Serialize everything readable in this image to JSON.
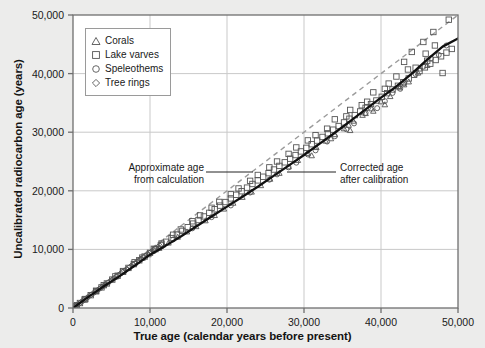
{
  "chart_data": {
    "type": "scatter",
    "title": "",
    "xlabel": "True age (calendar years before present)",
    "ylabel": "Uncalibrated radiocarbon age (years)",
    "xlim": [
      0,
      50000
    ],
    "ylim": [
      0,
      50000
    ],
    "xticks": [
      0,
      10000,
      20000,
      30000,
      40000,
      50000
    ],
    "yticks": [
      0,
      10000,
      20000,
      30000,
      40000,
      50000
    ],
    "xtick_labels": [
      "0",
      "10,000",
      "20,000",
      "30,000",
      "40,000",
      "50,000"
    ],
    "ytick_labels": [
      "0",
      "10,000",
      "20,000",
      "30,000",
      "40,000",
      "50,000"
    ],
    "grid": true,
    "legend_position": "upper-left",
    "legend_entries": [
      {
        "label": "Corals",
        "marker": "triangle"
      },
      {
        "label": "Lake varves",
        "marker": "square"
      },
      {
        "label": "Speleothems",
        "marker": "circle"
      },
      {
        "label": "Tree rings",
        "marker": "diamond"
      }
    ],
    "annotations": [
      {
        "name": "approximate-age",
        "line1": "Approximate age",
        "line2": "from calculation",
        "points_to": "one-to-one-dashed-line"
      },
      {
        "name": "corrected-age",
        "line1": "Corrected age",
        "line2": "after calibration",
        "points_to": "calibration-curve"
      }
    ],
    "reference_line": {
      "name": "one-to-one-line",
      "style": "dashed",
      "color": "#9b9b9b",
      "x": [
        0,
        50000
      ],
      "y": [
        0,
        50000
      ]
    },
    "calibration_curve": {
      "name": "calibration-curve",
      "style": "solid",
      "color": "#111111",
      "x": [
        0,
        2000,
        4000,
        6000,
        8000,
        10000,
        12000,
        14000,
        16000,
        18000,
        20000,
        22000,
        24000,
        26000,
        28000,
        30000,
        32000,
        34000,
        36000,
        38000,
        40000,
        42000,
        44000,
        46000,
        48000,
        50000
      ],
      "y": [
        0,
        1900,
        3700,
        5400,
        7200,
        9100,
        10600,
        12200,
        13900,
        15600,
        17300,
        19000,
        20700,
        22500,
        24300,
        26100,
        28000,
        29900,
        31900,
        33900,
        35900,
        37800,
        40000,
        42400,
        44600,
        46000
      ]
    },
    "series": [
      {
        "name": "Tree rings",
        "marker": "diamond",
        "points": [
          [
            180,
            170
          ],
          [
            420,
            400
          ],
          [
            700,
            660
          ],
          [
            980,
            930
          ],
          [
            1250,
            1190
          ],
          [
            1520,
            1450
          ],
          [
            1800,
            1720
          ],
          [
            2060,
            1970
          ],
          [
            2340,
            2230
          ],
          [
            2600,
            2480
          ],
          [
            2880,
            2740
          ],
          [
            3150,
            3000
          ],
          [
            3420,
            3260
          ],
          [
            3700,
            3520
          ],
          [
            3960,
            3770
          ],
          [
            4240,
            4040
          ],
          [
            4500,
            4290
          ],
          [
            4780,
            4540
          ],
          [
            5040,
            4790
          ],
          [
            5320,
            5060
          ],
          [
            5600,
            5320
          ],
          [
            5860,
            5570
          ],
          [
            6140,
            5830
          ],
          [
            6400,
            6080
          ],
          [
            6680,
            6340
          ],
          [
            6940,
            6580
          ],
          [
            7220,
            6840
          ],
          [
            7480,
            7090
          ],
          [
            7760,
            7350
          ],
          [
            8020,
            7590
          ],
          [
            8300,
            7850
          ],
          [
            8560,
            8100
          ],
          [
            8840,
            8360
          ],
          [
            9100,
            8600
          ],
          [
            9380,
            8870
          ],
          [
            9640,
            9110
          ],
          [
            9920,
            9370
          ],
          [
            10180,
            9620
          ],
          [
            10460,
            9880
          ],
          [
            10720,
            10120
          ],
          [
            11000,
            10380
          ],
          [
            11260,
            10620
          ],
          [
            11540,
            10880
          ]
        ]
      },
      {
        "name": "Corals",
        "marker": "triangle",
        "points": [
          [
            9800,
            9100
          ],
          [
            11200,
            10200
          ],
          [
            12400,
            11100
          ],
          [
            13600,
            12100
          ],
          [
            14800,
            13000
          ],
          [
            16000,
            13900
          ],
          [
            17200,
            14900
          ],
          [
            18400,
            15800
          ],
          [
            19600,
            16900
          ],
          [
            20800,
            17900
          ],
          [
            22000,
            18900
          ],
          [
            23200,
            19800
          ],
          [
            24400,
            20900
          ],
          [
            25600,
            22000
          ],
          [
            26800,
            23000
          ],
          [
            28000,
            24100
          ],
          [
            29200,
            25200
          ],
          [
            30400,
            26400
          ],
          [
            31600,
            27400
          ],
          [
            32800,
            28500
          ],
          [
            34000,
            29600
          ],
          [
            35200,
            30600
          ],
          [
            36400,
            31900
          ],
          [
            37600,
            32900
          ],
          [
            38800,
            34000
          ],
          [
            40000,
            35200
          ],
          [
            41200,
            36100
          ],
          [
            42400,
            37600
          ],
          [
            43600,
            38600
          ],
          [
            44800,
            40100
          ],
          [
            46000,
            41400
          ],
          [
            36000,
            30300
          ],
          [
            38000,
            33200
          ],
          [
            40500,
            34700
          ],
          [
            43000,
            38100
          ],
          [
            45000,
            40800
          ],
          [
            31000,
            26000
          ],
          [
            33500,
            28900
          ],
          [
            35800,
            31200
          ],
          [
            39000,
            33600
          ]
        ]
      },
      {
        "name": "Speleothems",
        "marker": "circle",
        "points": [
          [
            10500,
            9700
          ],
          [
            13000,
            11700
          ],
          [
            15500,
            13600
          ],
          [
            18000,
            15500
          ],
          [
            20500,
            17500
          ],
          [
            23000,
            19700
          ],
          [
            25500,
            21900
          ],
          [
            28000,
            24000
          ],
          [
            30500,
            26200
          ],
          [
            33000,
            28400
          ],
          [
            35500,
            30500
          ],
          [
            38000,
            33300
          ],
          [
            40500,
            35300
          ],
          [
            43000,
            38300
          ],
          [
            45500,
            41200
          ],
          [
            47500,
            43200
          ],
          [
            26500,
            22800
          ],
          [
            31500,
            26900
          ],
          [
            36500,
            31500
          ],
          [
            41500,
            36700
          ],
          [
            44500,
            39900
          ],
          [
            46500,
            42600
          ],
          [
            48500,
            44800
          ],
          [
            29000,
            24800
          ],
          [
            34000,
            29300
          ],
          [
            39500,
            34100
          ],
          [
            42500,
            37400
          ]
        ]
      },
      {
        "name": "Lake varves",
        "marker": "square",
        "points": [
          [
            300,
            280
          ],
          [
            900,
            850
          ],
          [
            1600,
            1530
          ],
          [
            2300,
            2190
          ],
          [
            3000,
            2850
          ],
          [
            3700,
            3520
          ],
          [
            4400,
            4190
          ],
          [
            5100,
            4850
          ],
          [
            5800,
            5510
          ],
          [
            6500,
            6180
          ],
          [
            7200,
            6840
          ],
          [
            7900,
            7490
          ],
          [
            8600,
            8140
          ],
          [
            9300,
            8780
          ],
          [
            10000,
            9420
          ],
          [
            10700,
            10050
          ],
          [
            11400,
            10680
          ],
          [
            12100,
            11300
          ],
          [
            12800,
            11930
          ],
          [
            13500,
            12540
          ],
          [
            14200,
            13160
          ],
          [
            14900,
            13780
          ],
          [
            15600,
            14400
          ],
          [
            16300,
            15010
          ],
          [
            17000,
            15620
          ],
          [
            17700,
            16240
          ],
          [
            18400,
            16860
          ],
          [
            19100,
            17470
          ],
          [
            19800,
            18080
          ],
          [
            20500,
            18700
          ],
          [
            21200,
            19320
          ],
          [
            21900,
            19930
          ],
          [
            22600,
            20540
          ],
          [
            23300,
            21160
          ],
          [
            24000,
            21780
          ],
          [
            24700,
            22400
          ],
          [
            25400,
            23010
          ],
          [
            26100,
            23630
          ],
          [
            26800,
            24250
          ],
          [
            27500,
            24860
          ],
          [
            28200,
            25480
          ],
          [
            28900,
            26100
          ],
          [
            29600,
            26720
          ],
          [
            30300,
            27330
          ],
          [
            31000,
            27950
          ],
          [
            31700,
            28570
          ],
          [
            32400,
            29190
          ],
          [
            33100,
            29810
          ],
          [
            33800,
            30430
          ],
          [
            34500,
            31050
          ],
          [
            35200,
            31670
          ],
          [
            35900,
            32300
          ],
          [
            36600,
            32920
          ],
          [
            37300,
            33540
          ],
          [
            38000,
            34160
          ],
          [
            38700,
            34790
          ],
          [
            39400,
            35410
          ],
          [
            40100,
            36040
          ],
          [
            40800,
            36660
          ],
          [
            41500,
            37290
          ],
          [
            42200,
            37920
          ],
          [
            42900,
            38540
          ],
          [
            43600,
            39170
          ],
          [
            44300,
            39800
          ],
          [
            45000,
            40430
          ],
          [
            45700,
            41060
          ],
          [
            46400,
            41690
          ],
          [
            47100,
            42320
          ],
          [
            47800,
            42950
          ],
          [
            48500,
            43580
          ],
          [
            49200,
            44210
          ],
          [
            44000,
            43700
          ],
          [
            45500,
            45400
          ],
          [
            46800,
            47100
          ],
          [
            48800,
            49200
          ],
          [
            47000,
            44800
          ],
          [
            42000,
            39500
          ],
          [
            43500,
            40700
          ],
          [
            39000,
            36800
          ],
          [
            41000,
            38300
          ],
          [
            44500,
            41000
          ],
          [
            46000,
            42200
          ],
          [
            36000,
            33800
          ],
          [
            37500,
            34600
          ],
          [
            34000,
            32200
          ],
          [
            31500,
            29500
          ],
          [
            29000,
            27400
          ],
          [
            26500,
            25000
          ],
          [
            24000,
            22700
          ],
          [
            21500,
            20400
          ],
          [
            19000,
            18100
          ],
          [
            16500,
            15800
          ],
          [
            14000,
            13400
          ],
          [
            11500,
            11000
          ],
          [
            9000,
            8600
          ],
          [
            6500,
            6300
          ],
          [
            4000,
            3900
          ],
          [
            1500,
            1450
          ],
          [
            48000,
            40100
          ],
          [
            43000,
            42000
          ],
          [
            45800,
            43400
          ],
          [
            40500,
            37400
          ],
          [
            38200,
            35200
          ],
          [
            35500,
            32700
          ],
          [
            33000,
            30600
          ],
          [
            30500,
            28600
          ],
          [
            28000,
            26300
          ],
          [
            25500,
            24000
          ],
          [
            23000,
            21700
          ],
          [
            20500,
            19400
          ],
          [
            18000,
            17100
          ],
          [
            15500,
            14800
          ],
          [
            13000,
            12500
          ],
          [
            10500,
            10100
          ],
          [
            8000,
            7800
          ],
          [
            5500,
            5400
          ],
          [
            3000,
            2950
          ],
          [
            500,
            480
          ]
        ]
      }
    ]
  },
  "axes": {
    "x_title": "True age (calendar years before present)",
    "y_title": "Uncalibrated radiocarbon age (years)"
  },
  "legend": {
    "items": [
      {
        "label": "Corals"
      },
      {
        "label": "Lake varves"
      },
      {
        "label": "Speleothems"
      },
      {
        "label": "Tree rings"
      }
    ]
  },
  "annotations": {
    "left": {
      "line1": "Approximate age",
      "line2": "from calculation"
    },
    "right": {
      "line1": "Corrected age",
      "line2": "after calibration"
    }
  },
  "colors": {
    "page_background": "#ececeb",
    "plot_background": "#ffffff",
    "grid": "#c9c9c9",
    "axis": "#6f6f6f",
    "curve": "#111111",
    "reference_line": "#9b9b9b",
    "marker": "#555555"
  }
}
